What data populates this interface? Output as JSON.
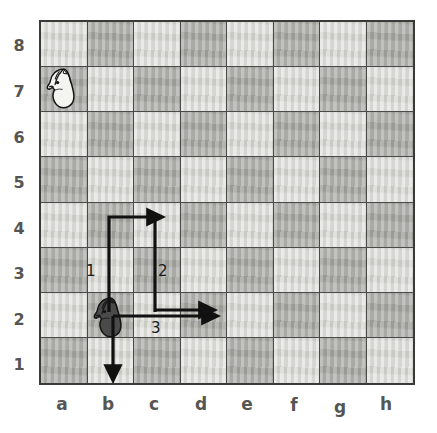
{
  "board": {
    "files": [
      "a",
      "b",
      "c",
      "d",
      "e",
      "f",
      "g",
      "h"
    ],
    "ranks": [
      "8",
      "7",
      "6",
      "5",
      "4",
      "3",
      "2",
      "1"
    ],
    "light_color": "#d9d9d5",
    "dark_color": "#a9a9a4",
    "border_color": "#3a3a3a",
    "grid_line_color": "#4a4a48",
    "label_color": "#555553",
    "size": 8,
    "squares": [
      [
        "light",
        "dark",
        "light",
        "dark",
        "light",
        "dark",
        "light",
        "dark"
      ],
      [
        "dark",
        "light",
        "dark",
        "light",
        "dark",
        "light",
        "dark",
        "light"
      ],
      [
        "light",
        "dark",
        "light",
        "dark",
        "light",
        "dark",
        "light",
        "dark"
      ],
      [
        "dark",
        "light",
        "dark",
        "light",
        "dark",
        "light",
        "dark",
        "light"
      ],
      [
        "light",
        "dark",
        "light",
        "dark",
        "light",
        "dark",
        "light",
        "dark"
      ],
      [
        "dark",
        "light",
        "dark",
        "light",
        "dark",
        "light",
        "dark",
        "light"
      ],
      [
        "light",
        "dark",
        "light",
        "dark",
        "light",
        "dark",
        "light",
        "dark"
      ],
      [
        "dark",
        "light",
        "dark",
        "light",
        "dark",
        "light",
        "dark",
        "light"
      ]
    ]
  },
  "pieces": [
    {
      "name": "white-knight",
      "type": "knight",
      "color": "white",
      "square": "a7",
      "file": 0,
      "rank": 7
    },
    {
      "name": "black-knight",
      "type": "knight",
      "color": "black",
      "square": "b2",
      "file": 1,
      "rank": 2
    }
  ],
  "annotations": {
    "arrow_color": "#111111",
    "arrows": [
      {
        "label": "1",
        "name": "move-arrow-1",
        "from": "b2",
        "to": "c4",
        "path": "up-then-right",
        "description": "From b2 up two squares to b4, then right one square to c4"
      },
      {
        "label": "2",
        "name": "move-arrow-2",
        "from": "c2",
        "to": "c4",
        "path": "up",
        "description": "From c2 up two squares to c4"
      },
      {
        "label": "3",
        "name": "move-arrow-3",
        "from": "b2",
        "to": "d2",
        "path": "right",
        "description": "From b2 right two squares to d2"
      },
      {
        "label": "",
        "name": "move-arrow-down",
        "from": "b2",
        "to": "b1",
        "path": "down",
        "description": "From b2 down to b1"
      }
    ],
    "labels": [
      {
        "text": "1",
        "name": "arrow-label-1",
        "x": 86,
        "y": 262
      },
      {
        "text": "2",
        "name": "arrow-label-2",
        "x": 158,
        "y": 262
      },
      {
        "text": "3",
        "name": "arrow-label-3",
        "x": 151,
        "y": 319
      }
    ]
  }
}
